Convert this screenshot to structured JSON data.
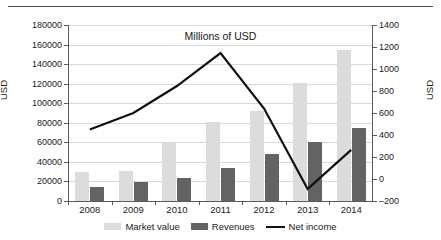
{
  "chart_data": {
    "type": "bar",
    "title": "Millions of USD",
    "xlabel": "",
    "ylabel": "USD",
    "ylabel_right": "USD",
    "categories": [
      "2008",
      "2009",
      "2010",
      "2011",
      "2012",
      "2013",
      "2014"
    ],
    "ylim": [
      0,
      180000
    ],
    "ytick_step": 20000,
    "yticks": [
      "0",
      "20000",
      "40000",
      "60000",
      "80000",
      "100000",
      "120000",
      "140000",
      "160000",
      "180000"
    ],
    "ylim_right": [
      -200,
      1400
    ],
    "ytick_step_right": 200,
    "yticks_right": [
      "-200",
      "0",
      "200",
      "400",
      "600",
      "800",
      "1000",
      "1200",
      "1400"
    ],
    "grid": true,
    "legend_position": "bottom",
    "series": [
      {
        "name": "Market value",
        "type": "bar",
        "axis": "left",
        "color": "#dcdcdc",
        "values": [
          29700,
          30700,
          59300,
          80700,
          92000,
          121000,
          154500
        ]
      },
      {
        "name": "Revenues",
        "type": "bar",
        "axis": "left",
        "color": "#636363",
        "values": [
          14300,
          19400,
          23500,
          34000,
          48000,
          60300,
          74700
        ]
      },
      {
        "name": "Net income",
        "type": "line",
        "axis": "right",
        "color": "#111111",
        "values": [
          450,
          600,
          845,
          1145,
          640,
          -90,
          265
        ]
      }
    ]
  }
}
